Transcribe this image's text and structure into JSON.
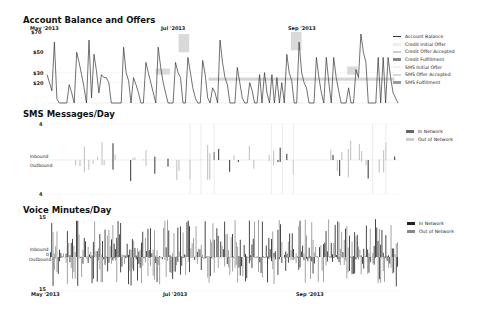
{
  "chart_data": [
    {
      "type": "line",
      "title": "Account Balance and Offers",
      "x_ticks": [
        "May '2013",
        "Jul '2013",
        "Sep '2013"
      ],
      "y_ticks": [
        "$70",
        "$50",
        "$30",
        "$20"
      ],
      "legend": [
        "Account Balance",
        "Credit Initial Offer",
        "Credit Offer Accepted",
        "Credit Fulfillment",
        "SMS Initial Offer",
        "SMS Offer Accepted",
        "SMS Fulfillment"
      ],
      "legend_position": "right",
      "series": [
        {
          "name": "Account Balance",
          "values": [
            28,
            20,
            12,
            60,
            4,
            0,
            0,
            0,
            0,
            18,
            10,
            0,
            50,
            40,
            28,
            15,
            0,
            62,
            5,
            48,
            32,
            10,
            28,
            25,
            25,
            20,
            0,
            0,
            0,
            0,
            0,
            55,
            30,
            22,
            0,
            25,
            18,
            10,
            0,
            0,
            40,
            30,
            20,
            10,
            0,
            55,
            35,
            20,
            10,
            0,
            0,
            0,
            40,
            30,
            25,
            0,
            0,
            45,
            30,
            15,
            5,
            0,
            0,
            42,
            28,
            5,
            0,
            15,
            10,
            0,
            62,
            40,
            25,
            18,
            0,
            0,
            0,
            35,
            20,
            5,
            0,
            0,
            20,
            12,
            0,
            0,
            28,
            0,
            30,
            10,
            0,
            28,
            0,
            25,
            0,
            20,
            0,
            48,
            30,
            22,
            0,
            0,
            60,
            30,
            20,
            15,
            0,
            0,
            0,
            45,
            25,
            10,
            0,
            45,
            20,
            0,
            45,
            25,
            12,
            0,
            0,
            0,
            15,
            0,
            0,
            33,
            25,
            68,
            50,
            40,
            0,
            0,
            0,
            0,
            45,
            0,
            45,
            0,
            45,
            25,
            10,
            5,
            0
          ]
        }
      ],
      "offers": [
        {
          "type": "Credit Offer Accepted",
          "x_start": 0.31,
          "x_end": 0.35,
          "y": [
            28,
            34
          ]
        },
        {
          "type": "Credit Offer Accepted",
          "x_start": 0.375,
          "x_end": 0.405,
          "y": [
            50,
            68
          ]
        },
        {
          "type": "Credit Fulfillment",
          "x_start": 0.46,
          "x_end": 0.99,
          "y": [
            22,
            25
          ]
        },
        {
          "type": "Credit Offer Accepted",
          "x_start": 0.695,
          "x_end": 0.725,
          "y": [
            52,
            70
          ]
        },
        {
          "type": "Credit Offer Accepted",
          "x_start": 0.855,
          "x_end": 0.885,
          "y": [
            28,
            36
          ]
        }
      ]
    },
    {
      "type": "bar",
      "title": "SMS Messages/Day",
      "y_ticks": [
        "4",
        "4"
      ],
      "y_labels": [
        "Inbound",
        "Outbound"
      ],
      "legend": [
        "In Network",
        "Out of Network"
      ],
      "legend_position": "right",
      "ylim": [
        -4,
        4
      ]
    },
    {
      "type": "bar",
      "title": "Voice Minutes/Day",
      "x_ticks": [
        "May '2013",
        "Jul '2013",
        "Sep '2013"
      ],
      "y_ticks": [
        "15",
        "0",
        "15"
      ],
      "y_labels": [
        "Inbound",
        "Outbound"
      ],
      "legend": [
        "In Network",
        "Out of Network"
      ],
      "legend_position": "right",
      "ylim": [
        -15,
        15
      ]
    }
  ],
  "charts": {
    "balance": {
      "title": "Account Balance and Offers",
      "x_ticks": [
        "May '2013",
        "Jul '2013",
        "Sep '2013"
      ],
      "y_ticks": [
        "$70",
        "$50",
        "$30",
        "$20"
      ],
      "legend": [
        "Account Balance",
        "Credit Initial Offer",
        "Credit Offer Accepted",
        "Credit Fulfillment",
        "SMS Initial Offer",
        "SMS Offer Accepted",
        "SMS Fulfillment"
      ]
    },
    "sms": {
      "title": "SMS Messages/Day",
      "y_top": "4",
      "y_bottom": "4",
      "inbound": "Inbound",
      "outbound": "Outbound",
      "legend": [
        "In Network",
        "Out of Network"
      ]
    },
    "voice": {
      "title": "Voice Minutes/Day",
      "y_top": "15",
      "y_zero": "0",
      "y_bottom": "15",
      "inbound": "Inbound",
      "outbound": "Outbound",
      "x_ticks": [
        "May '2013",
        "Jul '2013",
        "Sep '2013"
      ],
      "legend": [
        "In Network",
        "Out of Network"
      ]
    }
  },
  "colors": {
    "line": "#333333",
    "credit_initial": "#eeeeee",
    "credit_accepted": "#cccccc",
    "credit_fulfill": "#999999",
    "sms_initial": "#f0f0f0",
    "sms_accepted": "#d8d8d8",
    "sms_fulfill": "#aaaaaa",
    "in_network": "#333333",
    "out_network": "#aaaaaa"
  }
}
